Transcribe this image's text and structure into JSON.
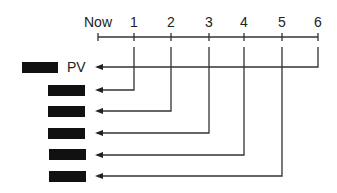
{
  "diagram": {
    "type": "timeline-cashflow",
    "timeline": {
      "labels": [
        "Now",
        "1",
        "2",
        "3",
        "4",
        "5",
        "6"
      ]
    },
    "pv_label": "PV",
    "rows": [
      {
        "period": "1",
        "label": "redacted box"
      },
      {
        "period": "2",
        "label": "redacted box"
      },
      {
        "period": "3",
        "label": "redacted box"
      },
      {
        "period": "4",
        "label": "redacted box"
      },
      {
        "period": "5",
        "label": "redacted box"
      }
    ],
    "colors": {
      "line": "#333333",
      "box": "#111111"
    }
  }
}
